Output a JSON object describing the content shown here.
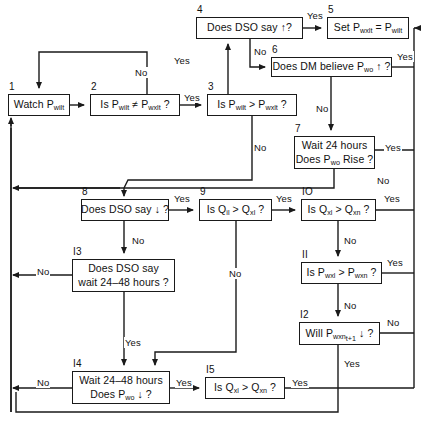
{
  "diagram": {
    "canvas": {
      "width": 421,
      "height": 432
    },
    "stroke_color": "#1a1a1a",
    "background_color": "#ffffff",
    "nodes": [
      {
        "id": "1",
        "number": "1",
        "lines": [
          "Watch P<sub>wilt</sub>"
        ],
        "x": 8,
        "y": 94,
        "w": 62,
        "h": 22
      },
      {
        "id": "2",
        "number": "2",
        "lines": [
          "Is P<sub>wilt</sub> ≠ P<sub>wxlt</sub> ?"
        ],
        "x": 90,
        "y": 94,
        "w": 90,
        "h": 22
      },
      {
        "id": "3",
        "number": "3",
        "lines": [
          "Is P<sub>wilt</sub> &gt; P<sub>wxlt</sub> ?"
        ],
        "x": 207,
        "y": 94,
        "w": 90,
        "h": 22
      },
      {
        "id": "4",
        "number": "4",
        "lines": [
          "Does DSO say ↑?"
        ],
        "x": 196,
        "y": 17,
        "w": 107,
        "h": 22
      },
      {
        "id": "5",
        "number": "5",
        "lines": [
          "Set P<sub>wxlt</sub> = P<sub>wilt</sub>"
        ],
        "x": 327,
        "y": 17,
        "w": 82,
        "h": 22
      },
      {
        "id": "6",
        "number": "6",
        "lines": [
          "Does DM believe P<sub>wo</sub> ↑ ?"
        ],
        "x": 271,
        "y": 57,
        "w": 121,
        "h": 20
      },
      {
        "id": "7",
        "number": "7",
        "lines": [
          "Wait 24 hours",
          "Does P<sub>wo</sub> Rise ?"
        ],
        "x": 294,
        "y": 136,
        "w": 81,
        "h": 33
      },
      {
        "id": "8",
        "number": "8",
        "lines": [
          "Does DSO say ↓ ?"
        ],
        "x": 81,
        "y": 199,
        "w": 88,
        "h": 22
      },
      {
        "id": "9",
        "number": "9",
        "lines": [
          "Is Q<sub>il</sub> &gt; Q<sub>xl</sub> ?"
        ],
        "x": 199,
        "y": 199,
        "w": 73,
        "h": 22
      },
      {
        "id": "10",
        "number": "IO",
        "lines": [
          "Is Q<sub>xl</sub> &gt; Q<sub>xn</sub> ?"
        ],
        "x": 301,
        "y": 199,
        "w": 75,
        "h": 22
      },
      {
        "id": "11",
        "number": "II",
        "lines": [
          "Is P<sub>wxl</sub> &gt; P<sub>wxn</sub> ?"
        ],
        "x": 301,
        "y": 262,
        "w": 81,
        "h": 22
      },
      {
        "id": "12",
        "number": "I2",
        "lines": [
          "Will P<sub>wxn<sub>t+1</sub></sub> ↓ ?"
        ],
        "x": 299,
        "y": 322,
        "w": 81,
        "h": 23
      },
      {
        "id": "13",
        "number": "I3",
        "lines": [
          "Does DSO say",
          "wait 24–48 hours ?"
        ],
        "x": 72,
        "y": 259,
        "w": 103,
        "h": 33
      },
      {
        "id": "14",
        "number": "I4",
        "lines": [
          "Wait 24–48 hours",
          "Does P<sub>wo</sub> ↓ ?"
        ],
        "x": 72,
        "y": 371,
        "w": 98,
        "h": 33
      },
      {
        "id": "15",
        "number": "I5",
        "lines": [
          "Is Q<sub>xl</sub> &gt; Q<sub>xn</sub> ?"
        ],
        "x": 205,
        "y": 377,
        "w": 80,
        "h": 22
      }
    ],
    "edge_labels": [
      {
        "id": "lbl-2-no",
        "text": "No",
        "x": 134,
        "y": 67
      },
      {
        "id": "lbl-2-yes",
        "text": "Yes",
        "x": 183,
        "y": 92
      },
      {
        "id": "lbl-3-yes",
        "text": "Yes",
        "x": 173,
        "y": 55
      },
      {
        "id": "lbl-3-no",
        "text": "No",
        "x": 253,
        "y": 142
      },
      {
        "id": "lbl-4-yes",
        "text": "Yes",
        "x": 306,
        "y": 10
      },
      {
        "id": "lbl-4-no",
        "text": "No",
        "x": 253,
        "y": 46
      },
      {
        "id": "lbl-6-yes",
        "text": "Yes",
        "x": 396,
        "y": 51
      },
      {
        "id": "lbl-6-no",
        "text": "No",
        "x": 315,
        "y": 103
      },
      {
        "id": "lbl-7-yes",
        "text": "Yes",
        "x": 384,
        "y": 142
      },
      {
        "id": "lbl-7-no",
        "text": "No",
        "x": 376,
        "y": 175
      },
      {
        "id": "lbl-8-yes",
        "text": "Yes",
        "x": 173,
        "y": 193
      },
      {
        "id": "lbl-8-no",
        "text": "No",
        "x": 131,
        "y": 235
      },
      {
        "id": "lbl-9-yes",
        "text": "Yes",
        "x": 275,
        "y": 193
      },
      {
        "id": "lbl-9-no",
        "text": "No",
        "x": 228,
        "y": 268
      },
      {
        "id": "lbl-10-yes",
        "text": "Yes",
        "x": 383,
        "y": 193
      },
      {
        "id": "lbl-10-no",
        "text": "No",
        "x": 343,
        "y": 235
      },
      {
        "id": "lbl-11-yes",
        "text": "Yes",
        "x": 386,
        "y": 257
      },
      {
        "id": "lbl-11-no",
        "text": "No",
        "x": 343,
        "y": 300
      },
      {
        "id": "lbl-12-no",
        "text": "No",
        "x": 386,
        "y": 317
      },
      {
        "id": "lbl-12-yes",
        "text": "Yes",
        "x": 343,
        "y": 358
      },
      {
        "id": "lbl-13-no",
        "text": "No",
        "x": 36,
        "y": 266
      },
      {
        "id": "lbl-13-yes",
        "text": "Yes",
        "x": 124,
        "y": 337
      },
      {
        "id": "lbl-14-no",
        "text": "No",
        "x": 36,
        "y": 377
      },
      {
        "id": "lbl-14-yes",
        "text": "Yes",
        "x": 175,
        "y": 377
      },
      {
        "id": "lbl-15-yes",
        "text": "Yes",
        "x": 291,
        "y": 377
      }
    ]
  }
}
